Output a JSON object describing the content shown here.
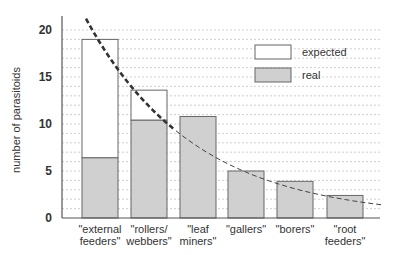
{
  "chart_data": {
    "type": "bar",
    "title": "",
    "xlabel": "",
    "ylabel": "number of parasitoids",
    "ylim": [
      0,
      21
    ],
    "yticks": [
      0,
      5,
      10,
      15,
      20
    ],
    "grid": true,
    "legend_position": "upper right",
    "categories": [
      [
        "\"external",
        "feeders\""
      ],
      [
        "\"rollers/",
        "webbers\""
      ],
      [
        "\"leaf",
        "miners\""
      ],
      [
        "\"gallers\""
      ],
      [
        "\"borers\""
      ],
      [
        "\"root",
        "feeders\""
      ]
    ],
    "category_names": [
      "external feeders",
      "rollers/webbers",
      "leaf miners",
      "gallers",
      "borers",
      "root feeders"
    ],
    "series": [
      {
        "name": "expected",
        "values": [
          19.0,
          13.6,
          10.8,
          5.0,
          3.9,
          2.4
        ],
        "color": "#ffffff"
      },
      {
        "name": "real",
        "values": [
          6.4,
          10.4,
          10.8,
          5.0,
          3.9,
          2.4
        ],
        "color": "#d0d0d0"
      }
    ],
    "trend_line": {
      "style": "dashed",
      "description": "decreasing exponential fit",
      "start": [
        0,
        21.5
      ],
      "end": [
        6.1,
        1.3
      ]
    }
  },
  "legend": {
    "expected_label": "expected",
    "real_label": "real"
  }
}
